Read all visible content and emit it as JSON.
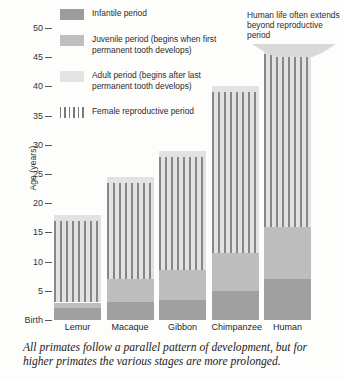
{
  "chart_data": {
    "type": "bar",
    "title": "",
    "xlabel": "",
    "ylabel": "Age (years)",
    "ylim": [
      0,
      52
    ],
    "grid": false,
    "legend_position": "top-left",
    "categories": [
      "Lemur",
      "Macaque",
      "Gibbon",
      "Chimpanzee",
      "Human"
    ],
    "ytick_labels": [
      "50",
      "45",
      "40",
      "35",
      "30",
      "25",
      "20",
      "15",
      "10",
      "5",
      "Birth"
    ],
    "ytick_values": [
      50,
      45,
      40,
      35,
      30,
      25,
      20,
      15,
      10,
      5,
      0
    ],
    "series": [
      {
        "name": "Infantile period",
        "values": [
          2.0,
          3.0,
          3.5,
          5.0,
          7.0
        ]
      },
      {
        "name": "Juvenile period",
        "values": [
          1.0,
          4.0,
          5.0,
          6.5,
          9.0
        ]
      },
      {
        "name": "Adult period",
        "values": [
          15.0,
          17.5,
          20.5,
          28.5,
          31.0
        ]
      }
    ],
    "totals": [
      18.0,
      24.5,
      29.0,
      40.0,
      47.0
    ],
    "reproductive_period": [
      {
        "category": "Lemur",
        "start": 3.0,
        "end": 17.0
      },
      {
        "category": "Macaque",
        "start": 7.0,
        "end": 23.5
      },
      {
        "category": "Gibbon",
        "start": 8.5,
        "end": 28.0
      },
      {
        "category": "Chimpanzee",
        "start": 11.5,
        "end": 39.0
      },
      {
        "category": "Human",
        "start": 16.0,
        "end": 45.5
      }
    ],
    "annotations": [
      {
        "text": "Human life often extends beyond reproductive period",
        "target": "Human"
      }
    ],
    "caption": "All primates follow a parallel pattern of development, but for higher primates the various stages are more prolonged."
  },
  "legend": {
    "items": [
      {
        "key": "infantile",
        "label": "Infantile period",
        "color": "#9c9c9c"
      },
      {
        "key": "juvenile",
        "label": "Juvenile period (begins when first permanent tooth develops)",
        "color": "#bfbfbf"
      },
      {
        "key": "adult",
        "label": "Adult period (begins after last permanent tooth develops)",
        "color": "#e4e4e4"
      },
      {
        "key": "reproductive",
        "label": "Female reproductive period",
        "color": "#7a7a7a"
      }
    ]
  },
  "annotation": {
    "text": "Human life often extends beyond reproductive period"
  },
  "axis": {
    "y_title": "Age (years)",
    "ticks": [
      "50",
      "45",
      "40",
      "35",
      "30",
      "25",
      "20",
      "15",
      "10",
      "5",
      "Birth"
    ]
  },
  "categories": {
    "items": [
      "Lemur",
      "Macaque",
      "Gibbon",
      "Chimpanzee",
      "Human"
    ]
  },
  "caption": {
    "text": "All primates follow a parallel pattern of development, but for higher primates the various stages are more prolonged."
  }
}
